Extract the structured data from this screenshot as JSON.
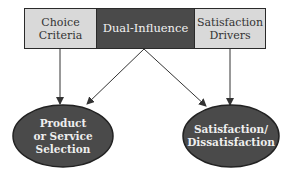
{
  "diagram": {
    "boxes": [
      {
        "id": "choice-criteria",
        "label": "Choice Criteria",
        "lines": [
          "Choice",
          "Criteria"
        ],
        "fill": "#d9d9d9"
      },
      {
        "id": "dual-influence",
        "label": "Dual-Influence",
        "lines": [
          "Dual-Influence"
        ],
        "fill": "#4a4a4a"
      },
      {
        "id": "satisfaction-drivers",
        "label": "Satisfaction Drivers",
        "lines": [
          "Satisfaction",
          "Drivers"
        ],
        "fill": "#d9d9d9"
      }
    ],
    "outcomes": [
      {
        "id": "product-selection",
        "label": "Product or Service Selection",
        "lines": [
          "Product",
          "or Service",
          "Selection"
        ],
        "fill": "#4a4a4a"
      },
      {
        "id": "satisfaction",
        "label": "Satisfaction/ Dissatisfaction",
        "lines": [
          "Satisfaction/",
          "Dissatisfaction"
        ],
        "fill": "#4a4a4a"
      }
    ],
    "edges": [
      {
        "from": "choice-criteria",
        "to": "product-selection"
      },
      {
        "from": "dual-influence",
        "to": "product-selection"
      },
      {
        "from": "dual-influence",
        "to": "satisfaction"
      },
      {
        "from": "satisfaction-drivers",
        "to": "satisfaction"
      }
    ]
  }
}
